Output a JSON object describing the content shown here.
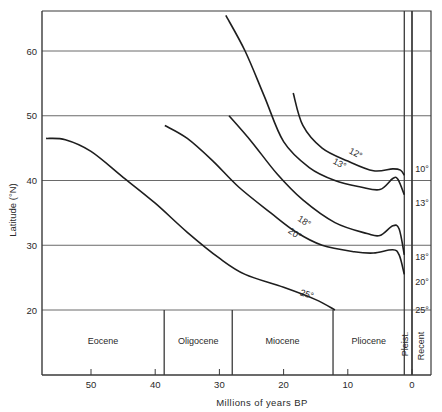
{
  "chart_data": {
    "type": "line",
    "title": "",
    "xlabel": "Millions of years BP",
    "ylabel": "Latitude (°N)",
    "xlim": [
      58,
      -3
    ],
    "ylim": [
      7,
      66
    ],
    "x_ticks": [
      50,
      40,
      30,
      20,
      10,
      0
    ],
    "y_ticks": [
      20,
      30,
      40,
      50,
      60
    ],
    "grid": {
      "horizontal": [
        20,
        30,
        40,
        50,
        60
      ],
      "vertical": false
    },
    "legend": "none (isotherm labels placed on curves)",
    "series": [
      {
        "name": "12°",
        "label_pos": [
          9,
          43.8
        ],
        "points": [
          [
            18.5,
            53.5
          ],
          [
            17,
            48.5
          ],
          [
            14,
            45
          ],
          [
            10,
            43
          ],
          [
            6,
            41.5
          ],
          [
            3,
            41.8
          ],
          [
            1.8,
            41.6
          ],
          [
            1.2,
            40.8
          ]
        ]
      },
      {
        "name": "13°",
        "label_pos": [
          11.5,
          42.2
        ],
        "points": [
          [
            29,
            65.5
          ],
          [
            26,
            60
          ],
          [
            23,
            53
          ],
          [
            20,
            46
          ],
          [
            16,
            42
          ],
          [
            12,
            40
          ],
          [
            8,
            39
          ],
          [
            5,
            38.6
          ],
          [
            3,
            40.3
          ],
          [
            2.2,
            40.2
          ],
          [
            1.2,
            37.8
          ]
        ]
      },
      {
        "name": "18°",
        "label_pos": [
          17,
          33.3
        ],
        "points": [
          [
            28.5,
            50
          ],
          [
            25,
            46
          ],
          [
            21,
            41
          ],
          [
            17,
            37
          ],
          [
            12,
            33.5
          ],
          [
            7,
            31.8
          ],
          [
            5,
            31.5
          ],
          [
            3,
            33
          ],
          [
            2,
            32.5
          ],
          [
            1.2,
            28.5
          ]
        ]
      },
      {
        "name": "20°",
        "label_pos": [
          18.5,
          31.4
        ],
        "points": [
          [
            38.5,
            48.5
          ],
          [
            35,
            46.5
          ],
          [
            31,
            43
          ],
          [
            27,
            39
          ],
          [
            22,
            35
          ],
          [
            18,
            32
          ],
          [
            14,
            30
          ],
          [
            9,
            29
          ],
          [
            6,
            28.8
          ],
          [
            3,
            29.3
          ],
          [
            2,
            28.5
          ],
          [
            1.2,
            25.5
          ]
        ]
      },
      {
        "name": "25°",
        "label_pos": [
          16.5,
          22
        ],
        "points": [
          [
            57,
            46.5
          ],
          [
            54,
            46.3
          ],
          [
            50,
            44.5
          ],
          [
            45,
            40.5
          ],
          [
            40,
            36.5
          ],
          [
            35,
            32
          ],
          [
            30,
            28
          ],
          [
            26,
            25.5
          ],
          [
            20,
            23.5
          ],
          [
            15,
            21.6
          ],
          [
            12,
            20
          ]
        ]
      }
    ],
    "epochs": [
      {
        "name": "Eocene",
        "start": 58,
        "end": 38.6
      },
      {
        "name": "Oligocene",
        "start": 38.6,
        "end": 28
      },
      {
        "name": "Miocene",
        "start": 28,
        "end": 12.3
      },
      {
        "name": "Pliocene",
        "start": 12.3,
        "end": 1.2
      },
      {
        "name": "Pleist.",
        "start": 1.2,
        "end": 0
      },
      {
        "name": "Recent",
        "start": 0,
        "end": -3
      }
    ],
    "recent_isotherm_labels": [
      {
        "label": "10°",
        "lat": 41.8
      },
      {
        "label": "13°",
        "lat": 36.5
      },
      {
        "label": "18°",
        "lat": 28.2
      },
      {
        "label": "20°",
        "lat": 24.3
      },
      {
        "label": "25°",
        "lat": 20
      }
    ]
  },
  "ui": {
    "x_tick_labels": [
      "50",
      "40",
      "30",
      "20",
      "10",
      "0"
    ],
    "y_tick_labels": [
      "20",
      "30",
      "40",
      "50",
      "60"
    ],
    "xlabel": "Millions of years BP",
    "ylabel": "Latitude (°N)"
  }
}
